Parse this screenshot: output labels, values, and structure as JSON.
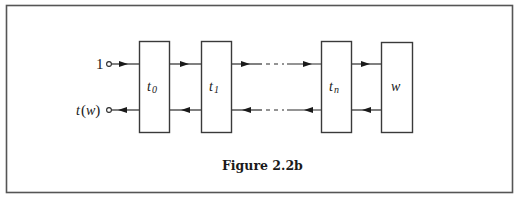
{
  "figure": {
    "caption": "Figure 2.2b"
  },
  "ports": {
    "input_label": "1",
    "output_label_t": "t",
    "output_label_open": "(",
    "output_label_w": "w",
    "output_label_close": ")"
  },
  "boxes": [
    {
      "id": "t0",
      "symbol": "t",
      "subscript": "0"
    },
    {
      "id": "t1",
      "symbol": "t",
      "subscript": "1"
    },
    {
      "id": "tn",
      "symbol": "t",
      "subscript": "n"
    },
    {
      "id": "w",
      "symbol": "w",
      "subscript": ""
    }
  ],
  "colors": {
    "frame": "#555555",
    "stroke": "#2a2a2a",
    "background": "#ffffff"
  }
}
